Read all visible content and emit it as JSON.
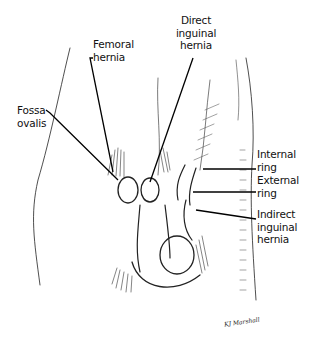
{
  "figure": {
    "type": "anatomical line illustration",
    "labels": {
      "femoral_hernia": "Femoral\nhernia",
      "direct_inguinal_hernia": "Direct\ninguinal\nhernia",
      "fossa_ovalis": "Fossa\novalis",
      "internal_ring": "Internal\nring",
      "external_ring": "External\nring",
      "indirect_inguinal_hernia": "Indirect\ninguinal\nhernia"
    },
    "signature": "KJ Marshall",
    "colors": {
      "ink": "#111111",
      "background": "#ffffff"
    }
  }
}
